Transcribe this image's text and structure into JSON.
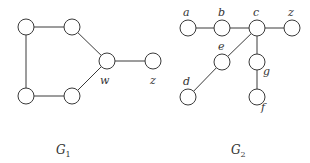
{
  "graphs": [
    {
      "name": "G",
      "subscript": "1",
      "title_pos": [
        56,
        154
      ],
      "nodes": [
        {
          "id": "v1",
          "label": "",
          "x": 26,
          "y": 27
        },
        {
          "id": "v2",
          "label": "",
          "x": 72,
          "y": 27
        },
        {
          "id": "w",
          "label": "w",
          "x": 107,
          "y": 61,
          "lx": 100,
          "ly": 84
        },
        {
          "id": "v4",
          "label": "",
          "x": 72,
          "y": 96
        },
        {
          "id": "v5",
          "label": "",
          "x": 26,
          "y": 96
        },
        {
          "id": "z",
          "label": "z",
          "x": 153,
          "y": 61,
          "lx": 150,
          "ly": 84
        }
      ],
      "edges": [
        [
          "v1",
          "v2"
        ],
        [
          "v2",
          "w"
        ],
        [
          "w",
          "v4"
        ],
        [
          "v4",
          "v5"
        ],
        [
          "v5",
          "v1"
        ],
        [
          "w",
          "z"
        ]
      ]
    },
    {
      "name": "G",
      "subscript": "2",
      "title_pos": [
        231,
        154
      ],
      "nodes": [
        {
          "id": "a",
          "label": "a",
          "x": 188,
          "y": 28,
          "lx": 183,
          "ly": 16
        },
        {
          "id": "b",
          "label": "b",
          "x": 222,
          "y": 28,
          "lx": 218,
          "ly": 16
        },
        {
          "id": "c",
          "label": "c",
          "x": 257,
          "y": 28,
          "lx": 253,
          "ly": 16
        },
        {
          "id": "z",
          "label": "z",
          "x": 292,
          "y": 28,
          "lx": 288,
          "ly": 16
        },
        {
          "id": "e",
          "label": "e",
          "x": 222,
          "y": 62,
          "lx": 218,
          "ly": 50
        },
        {
          "id": "g",
          "label": "g",
          "x": 257,
          "y": 62,
          "lx": 263,
          "ly": 75
        },
        {
          "id": "d",
          "label": "d",
          "x": 188,
          "y": 97,
          "lx": 183,
          "ly": 85
        },
        {
          "id": "f",
          "label": "f",
          "x": 257,
          "y": 97,
          "lx": 261,
          "ly": 111
        }
      ],
      "edges": [
        [
          "a",
          "b"
        ],
        [
          "b",
          "c"
        ],
        [
          "c",
          "z"
        ],
        [
          "c",
          "e"
        ],
        [
          "e",
          "d"
        ],
        [
          "c",
          "g"
        ],
        [
          "g",
          "f"
        ]
      ]
    }
  ],
  "style": {
    "node_radius": 8,
    "stroke_color": "#3a3a3a"
  }
}
